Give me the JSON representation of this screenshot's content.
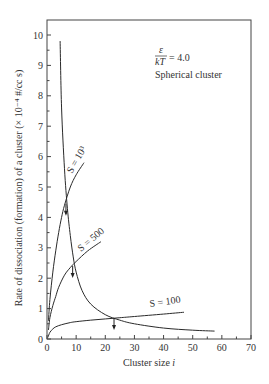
{
  "chart_data": {
    "type": "line",
    "title": "",
    "xlabel": "Cluster size i",
    "ylabel": "Rate of dissociation (formation) of a cluster (× 10⁻⁴ #/cc s)",
    "xlim": [
      0,
      70
    ],
    "ylim": [
      0,
      10.5
    ],
    "xticks": [
      0,
      10,
      20,
      30,
      40,
      50,
      60,
      70
    ],
    "yticks": [
      0,
      1,
      2,
      3,
      4,
      5,
      6,
      7,
      8,
      9,
      10
    ],
    "grid": false,
    "annotations": [
      {
        "text": "ε/kT = 4.0",
        "x": 45,
        "y": 9.6
      },
      {
        "text": "Spherical cluster",
        "x": 45,
        "y": 8.9
      }
    ],
    "series": [
      {
        "name": "Dissociation rate",
        "x": [
          4.5,
          5,
          6,
          7,
          8,
          9,
          10,
          12,
          15,
          20,
          25,
          30,
          40,
          50,
          57.5
        ],
        "y": [
          9.8,
          7.6,
          5.6,
          4.3,
          3.4,
          2.7,
          2.2,
          1.6,
          1.15,
          0.8,
          0.62,
          0.5,
          0.36,
          0.29,
          0.26
        ]
      },
      {
        "name": "S = 10^3",
        "x": [
          0.5,
          1,
          2,
          3,
          4,
          5,
          6,
          8,
          10,
          12.7
        ],
        "y": [
          0.6,
          1.3,
          2.2,
          2.9,
          3.5,
          4.0,
          4.4,
          5.0,
          5.4,
          5.8
        ]
      },
      {
        "name": "S = 500",
        "x": [
          0.5,
          1,
          2,
          3,
          4,
          6,
          8,
          10,
          14,
          18.5
        ],
        "y": [
          0.3,
          0.7,
          1.1,
          1.4,
          1.7,
          2.1,
          2.35,
          2.55,
          2.9,
          3.2
        ]
      },
      {
        "name": "S = 100",
        "x": [
          0.3,
          1,
          2,
          3,
          5,
          8,
          10,
          15,
          20,
          25,
          30,
          40,
          47
        ],
        "y": [
          0.05,
          0.22,
          0.33,
          0.4,
          0.47,
          0.54,
          0.57,
          0.62,
          0.66,
          0.7,
          0.74,
          0.82,
          0.88
        ]
      }
    ],
    "intersections": [
      {
        "series": "S = 10^3",
        "x": 6.5,
        "y": 4.45
      },
      {
        "series": "S = 500",
        "x": 8.8,
        "y": 2.4
      },
      {
        "series": "S = 100",
        "x": 23,
        "y": 0.69
      }
    ],
    "series_labels": [
      {
        "text": "S = 10³",
        "x": 8,
        "y": 5.3,
        "angle": -60
      },
      {
        "text": "S = 500",
        "x": 12,
        "y": 2.95,
        "angle": -42
      },
      {
        "text": "S = 100",
        "x": 34,
        "y": 0.92,
        "angle": -8
      }
    ]
  },
  "labels": {
    "xlabel": "Cluster size ",
    "xlabel_var": "i",
    "ylabel": "Rate of dissociation (formation) of a cluster (× 10⁻⁴ #/cc s)",
    "eps": "ε",
    "kT": "kT",
    "eq": "= 4.0",
    "shape": "Spherical cluster",
    "s1000": "S = 10³",
    "s500": "S = 500",
    "s100": "S = 100"
  }
}
